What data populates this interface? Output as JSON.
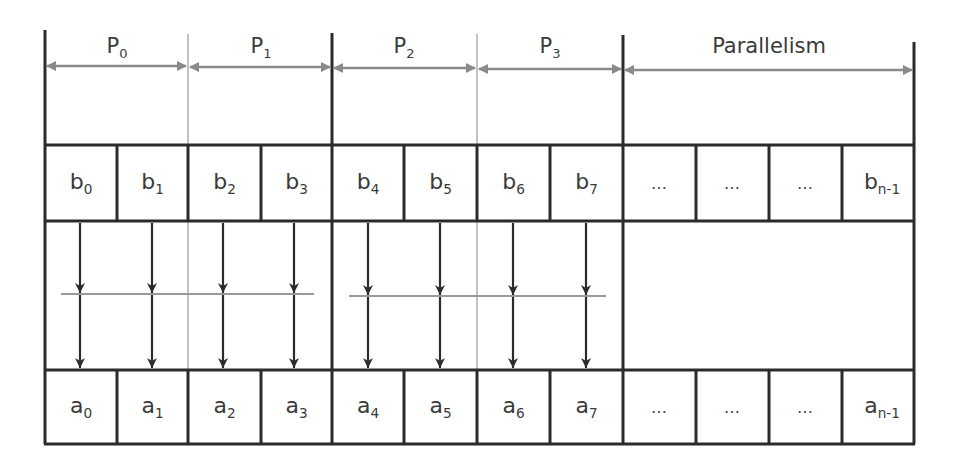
{
  "diagram": {
    "title_labels": [
      {
        "id": "p0",
        "base": "P",
        "sub": "0",
        "cx": 117
      },
      {
        "id": "p1",
        "base": "P",
        "sub": "1",
        "cx": 261
      },
      {
        "id": "p2",
        "base": "P",
        "sub": "2",
        "cx": 404
      },
      {
        "id": "p3",
        "base": "P",
        "sub": "3",
        "cx": 550
      },
      {
        "id": "parallelism",
        "base": "Parallelism",
        "sub": "",
        "cx": 769
      }
    ],
    "b_row": [
      {
        "base": "b",
        "sub": "0"
      },
      {
        "base": "b",
        "sub": "1"
      },
      {
        "base": "b",
        "sub": "2"
      },
      {
        "base": "b",
        "sub": "3"
      },
      {
        "base": "b",
        "sub": "4"
      },
      {
        "base": "b",
        "sub": "5"
      },
      {
        "base": "b",
        "sub": "6"
      },
      {
        "base": "b",
        "sub": "7"
      },
      {
        "base": "…",
        "sub": ""
      },
      {
        "base": "…",
        "sub": ""
      },
      {
        "base": "…",
        "sub": ""
      },
      {
        "base": "b",
        "sub": "n-1"
      }
    ],
    "a_row": [
      {
        "base": "a",
        "sub": "0"
      },
      {
        "base": "a",
        "sub": "1"
      },
      {
        "base": "a",
        "sub": "2"
      },
      {
        "base": "a",
        "sub": "3"
      },
      {
        "base": "a",
        "sub": "4"
      },
      {
        "base": "a",
        "sub": "5"
      },
      {
        "base": "a",
        "sub": "6"
      },
      {
        "base": "a",
        "sub": "7"
      },
      {
        "base": "…",
        "sub": ""
      },
      {
        "base": "…",
        "sub": ""
      },
      {
        "base": "…",
        "sub": ""
      },
      {
        "base": "a",
        "sub": "n-1"
      }
    ],
    "column_edges": [
      45,
      117,
      188,
      261,
      332,
      404,
      477,
      550,
      623,
      696,
      769,
      842,
      914
    ],
    "thick_dividers": [
      45,
      332,
      623,
      914
    ],
    "thin_dividers": [
      188,
      477
    ],
    "arrow_x": [
      80,
      152,
      223,
      294,
      368,
      440,
      513,
      586
    ],
    "colors": {
      "line": "#2b2b2b",
      "gray_line": "#999999",
      "dim_arrow": "#8a8a8a",
      "text": "#3a3a3a"
    }
  }
}
